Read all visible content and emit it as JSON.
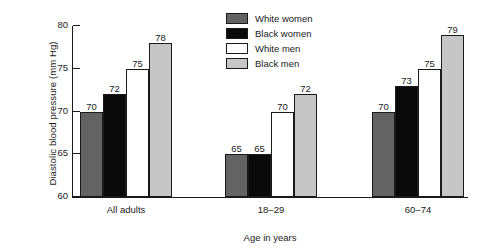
{
  "chart_data": {
    "type": "bar",
    "title": "",
    "xlabel": "Age in years",
    "ylabel": "Diastolic blood pressure (mm Hg)",
    "categories": [
      "All adults",
      "18–29",
      "60–74"
    ],
    "ylim": [
      60,
      80
    ],
    "yticks": [
      60,
      65,
      70,
      75,
      80
    ],
    "ytick_labels": [
      "60",
      "65",
      "70",
      "75",
      "80"
    ],
    "grid": false,
    "legend_position": "top-center",
    "show_values": true,
    "series": [
      {
        "name": "White women",
        "color": "#636363",
        "values": [
          70,
          65,
          70
        ],
        "value_labels": [
          "70",
          "65",
          "70"
        ]
      },
      {
        "name": "Black women",
        "color": "#0a0a0a",
        "values": [
          72,
          65,
          73
        ],
        "value_labels": [
          "72",
          "65",
          "73"
        ]
      },
      {
        "name": "White men",
        "color": "#ffffff",
        "values": [
          75,
          70,
          75
        ],
        "value_labels": [
          "75",
          "70",
          "75"
        ]
      },
      {
        "name": "Black men",
        "color": "#c6c6c6",
        "values": [
          78,
          72,
          79
        ],
        "value_labels": [
          "78",
          "72",
          "79"
        ]
      }
    ]
  },
  "legend": {
    "items": [
      {
        "label": "White women"
      },
      {
        "label": "Black women"
      },
      {
        "label": "White men"
      },
      {
        "label": "Black men"
      }
    ]
  },
  "colors": {
    "axis": "#1a1a1a",
    "background": "#ffffff",
    "white_women": "#636363",
    "black_women": "#0a0a0a",
    "white_men": "#ffffff",
    "black_men": "#c6c6c6"
  }
}
